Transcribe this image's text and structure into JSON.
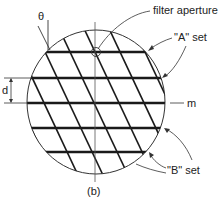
{
  "figure": {
    "caption": "(b)",
    "labels": {
      "theta": "θ",
      "filter_aperture": "filter aperture",
      "a_set": "\"A\" set",
      "b_set": "\"B\" set",
      "d": "d",
      "m": "m"
    },
    "colors": {
      "ink": "#1a1a1a",
      "background": "#ffffff"
    },
    "grating": {
      "horizontal_lines_y": [
        52,
        78,
        103,
        128,
        152
      ],
      "diagonal_direction": "top-left to bottom-right",
      "angle_label": "θ"
    }
  }
}
